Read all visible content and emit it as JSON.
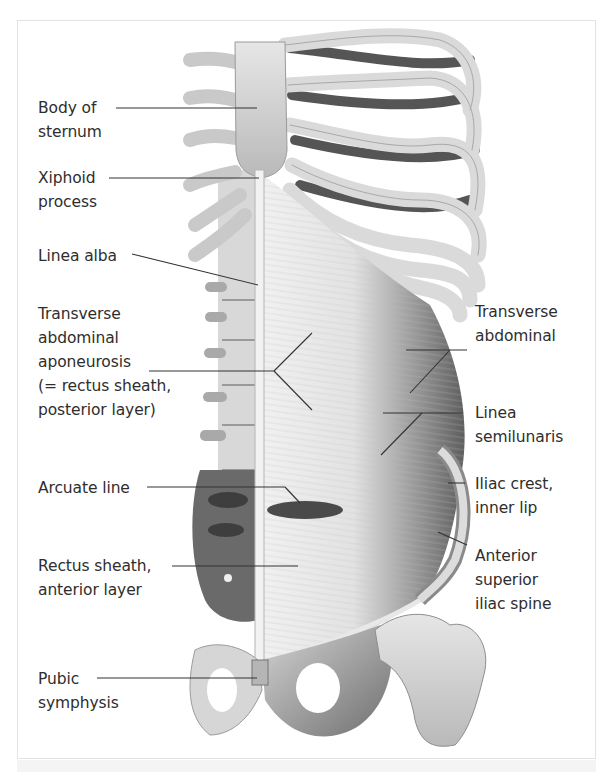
{
  "figure": {
    "labels_left": [
      {
        "id": "body-of-sternum",
        "text": "Body of\nsternum"
      },
      {
        "id": "xiphoid-process",
        "text": "Xiphoid\nprocess"
      },
      {
        "id": "linea-alba",
        "text": "Linea alba"
      },
      {
        "id": "transverse-abdominal-aponeurosis",
        "text": "Transverse\nabdominal\naponeurosis\n(= rectus sheath,\nposterior layer)"
      },
      {
        "id": "arcuate-line",
        "text": "Arcuate line"
      },
      {
        "id": "rectus-sheath-anterior-layer",
        "text": "Rectus sheath,\nanterior layer"
      },
      {
        "id": "pubic-symphysis",
        "text": "Pubic\nsymphysis"
      }
    ],
    "labels_right": [
      {
        "id": "transverse-abdominal",
        "text": "Transverse\nabdominal"
      },
      {
        "id": "linea-semilunaris",
        "text": "Linea\nsemilunaris"
      },
      {
        "id": "iliac-crest-inner-lip",
        "text": "Iliac crest,\ninner lip"
      },
      {
        "id": "anterior-superior-iliac-spine",
        "text": "Anterior\nsuperior\niliac spine"
      }
    ]
  }
}
